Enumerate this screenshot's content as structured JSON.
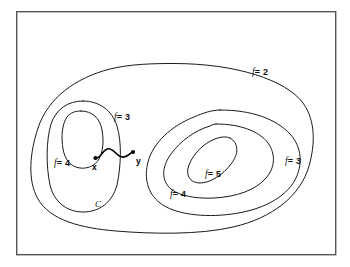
{
  "figure": {
    "kind": "level-set-contour-diagram",
    "background_color": "#ffffff",
    "stroke_color": "#1a1a1a",
    "frame_color": "#555555",
    "frame": {
      "x": 16,
      "y": 11,
      "width": 320,
      "height": 244
    }
  },
  "labels": {
    "f_outer": {
      "fvar": "f",
      "value": "= 2",
      "x": 252,
      "y": 68
    },
    "f_left_outer": {
      "fvar": "f",
      "value": "= 3",
      "x": 114,
      "y": 113
    },
    "f_left_inner": {
      "fvar": "f",
      "value": "= 4",
      "x": 54,
      "y": 159
    },
    "f_right_outer": {
      "fvar": "f",
      "value": "= 3",
      "x": 285,
      "y": 157
    },
    "f_right_middle": {
      "fvar": "f",
      "value": "= 4",
      "x": 170,
      "y": 190
    },
    "f_right_inner": {
      "fvar": "f",
      "value": "= 5",
      "x": 205,
      "y": 170
    }
  },
  "points": {
    "x": {
      "label": "x",
      "dot_x": 95,
      "dot_y": 158,
      "label_x": 92,
      "label_y": 163
    },
    "y": {
      "label": "y",
      "dot_x": 133,
      "dot_y": 152,
      "label_x": 136,
      "label_y": 157
    }
  },
  "set_labels": {
    "C": {
      "label": "C",
      "x": 95,
      "y": 200
    }
  },
  "contours": [
    {
      "name": "f-equals-2-outer-oval",
      "level": 2
    },
    {
      "name": "f-equals-3-left-oval",
      "level": 3
    },
    {
      "name": "f-equals-4-left-inner-oval",
      "level": 4
    },
    {
      "name": "f-equals-3-right-oval",
      "level": 3
    },
    {
      "name": "f-equals-4-right-oval",
      "level": 4
    },
    {
      "name": "f-equals-5-right-inner-oval",
      "level": 5
    }
  ],
  "connector": {
    "name": "path-from-x-to-y",
    "description": "wiggly curve joining point x to point y"
  }
}
